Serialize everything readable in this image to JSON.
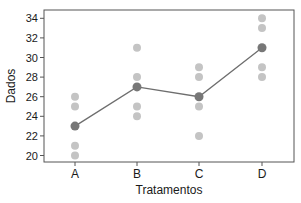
{
  "chart_data": {
    "type": "scatter",
    "title": "",
    "xlabel": "Tratamentos",
    "ylabel": "Dados",
    "categories": [
      "A",
      "B",
      "C",
      "D"
    ],
    "ylim": [
      19.5,
      34.8
    ],
    "yticks": [
      20,
      22,
      24,
      26,
      28,
      30,
      32,
      34
    ],
    "grid": false,
    "legend": null,
    "series": [
      {
        "name": "observations",
        "kind": "scatter",
        "color": "#c4c4c4",
        "points": {
          "A": [
            26,
            25,
            21,
            20
          ],
          "B": [
            31,
            28,
            25,
            24
          ],
          "C": [
            29,
            28,
            25,
            22
          ],
          "D": [
            34,
            33,
            29,
            28
          ]
        }
      },
      {
        "name": "means",
        "kind": "line+markers",
        "color": "#777777",
        "line_color": "#6e6e6e",
        "values": [
          23,
          27,
          26,
          31
        ]
      }
    ]
  }
}
